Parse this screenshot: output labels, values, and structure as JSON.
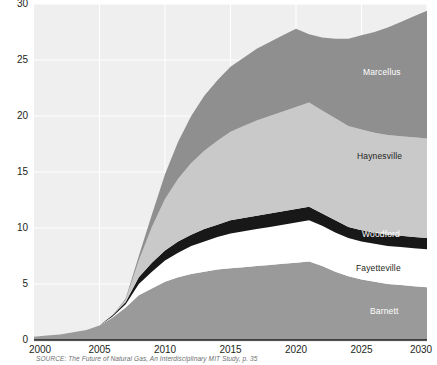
{
  "chart_data": {
    "type": "area",
    "stacked": true,
    "title": "",
    "subtitle": "",
    "xlabel": "",
    "ylabel": "",
    "xlim": [
      2000,
      2030
    ],
    "ylim": [
      0,
      30
    ],
    "grid": true,
    "legend_position": "inline-right",
    "xticks": [
      "2000",
      "2005",
      "2010",
      "2015",
      "2020",
      "2025",
      "2030"
    ],
    "yticks": [
      "0",
      "5",
      "10",
      "15",
      "20",
      "25",
      "30"
    ],
    "x": [
      2000,
      2001,
      2002,
      2003,
      2004,
      2005,
      2006,
      2007,
      2008,
      2009,
      2010,
      2011,
      2012,
      2013,
      2014,
      2015,
      2016,
      2017,
      2018,
      2019,
      2020,
      2021,
      2022,
      2023,
      2024,
      2025,
      2026,
      2027,
      2028,
      2029,
      2030
    ],
    "series": [
      {
        "name": "Barnett",
        "color": "#9a9a9a",
        "label_color": "#ffffff",
        "values": [
          0.3,
          0.4,
          0.5,
          0.7,
          0.9,
          1.3,
          2.0,
          2.9,
          4.0,
          4.6,
          5.2,
          5.6,
          5.9,
          6.1,
          6.3,
          6.4,
          6.5,
          6.6,
          6.7,
          6.8,
          6.9,
          7.0,
          6.6,
          6.1,
          5.7,
          5.4,
          5.2,
          5.0,
          4.9,
          4.8,
          4.7
        ]
      },
      {
        "name": "Fayetteville",
        "color": "#ffffff",
        "label_color": "#231f20",
        "values": [
          0.0,
          0.0,
          0.0,
          0.0,
          0.0,
          0.0,
          0.1,
          0.3,
          1.0,
          1.5,
          1.9,
          2.2,
          2.5,
          2.7,
          2.9,
          3.1,
          3.2,
          3.3,
          3.4,
          3.5,
          3.6,
          3.7,
          3.6,
          3.5,
          3.4,
          3.4,
          3.4,
          3.4,
          3.4,
          3.4,
          3.4
        ]
      },
      {
        "name": "Woodford",
        "color": "#181818",
        "label_color": "#ffffff",
        "values": [
          0.0,
          0.0,
          0.0,
          0.0,
          0.0,
          0.0,
          0.1,
          0.2,
          0.6,
          0.8,
          0.9,
          1.0,
          1.0,
          1.1,
          1.1,
          1.2,
          1.2,
          1.2,
          1.2,
          1.2,
          1.2,
          1.2,
          1.1,
          1.1,
          1.0,
          1.0,
          1.0,
          1.0,
          1.0,
          1.0,
          1.0
        ]
      },
      {
        "name": "Haynesville",
        "color": "#c9c9c9",
        "label_color": "#231f20",
        "values": [
          0.0,
          0.0,
          0.0,
          0.0,
          0.0,
          0.0,
          0.0,
          0.2,
          1.5,
          3.2,
          4.6,
          5.6,
          6.4,
          7.0,
          7.5,
          7.9,
          8.2,
          8.5,
          8.7,
          8.9,
          9.1,
          9.3,
          9.2,
          9.1,
          9.0,
          9.0,
          8.9,
          8.9,
          8.9,
          8.9,
          8.9
        ]
      },
      {
        "name": "Marcellus",
        "color": "#8f8f8f",
        "label_color": "#ffffff",
        "values": [
          0.0,
          0.0,
          0.0,
          0.0,
          0.0,
          0.0,
          0.0,
          0.1,
          0.4,
          1.1,
          2.2,
          3.3,
          4.2,
          4.9,
          5.4,
          5.8,
          6.1,
          6.4,
          6.6,
          6.8,
          7.0,
          6.1,
          6.5,
          7.1,
          7.8,
          8.4,
          9.0,
          9.6,
          10.2,
          10.8,
          11.4
        ]
      }
    ],
    "totals": [
      0.3,
      0.4,
      0.5,
      0.7,
      0.9,
      1.3,
      2.2,
      3.7,
      7.5,
      11.2,
      14.8,
      17.7,
      20.0,
      21.8,
      23.2,
      24.4,
      25.2,
      26.0,
      26.6,
      27.2,
      27.8,
      27.3,
      27.0,
      26.9,
      26.9,
      27.2,
      27.5,
      27.9,
      28.4,
      28.9,
      29.4
    ],
    "source": "SOURCE: The Future of Natural Gas, An Interdisciplinary MIT Study, p. 35"
  }
}
